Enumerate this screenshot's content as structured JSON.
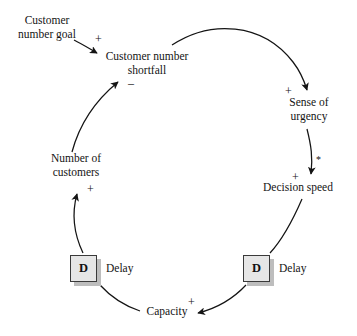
{
  "diagram": {
    "type": "causal-loop-diagram",
    "title": "",
    "ink_color": "#141414",
    "delay_box_fill": "#e6e6e6",
    "delay_box_shadow": "#bdbdbd"
  },
  "nodes": {
    "customer_number_goal": {
      "line1": "Customer",
      "line2": "number goal"
    },
    "customer_number_shortfall": {
      "line1": "Customer number",
      "line2": "shortfall"
    },
    "sense_of_urgency": {
      "line1": "Sense of",
      "line2": "urgency"
    },
    "decision_speed": {
      "line1": "Decision speed",
      "line2": ""
    },
    "capacity": {
      "line1": "Capacity",
      "line2": ""
    },
    "number_of_customers": {
      "line1": "Number of",
      "line2": "customers"
    }
  },
  "delays": {
    "left": {
      "glyph": "D",
      "label": "Delay"
    },
    "right": {
      "glyph": "D",
      "label": "Delay"
    }
  },
  "polarities": {
    "goal_to_shortfall": "+",
    "shortfall_to_urgency": "+",
    "urgency_to_speed_sign": "+",
    "urgency_to_speed_mark": "*",
    "capacity_in": "+",
    "customers_in": "+",
    "customers_to_shortfall": "–"
  },
  "links": [
    {
      "from": "customer_number_goal",
      "to": "customer_number_shortfall",
      "sign": "+"
    },
    {
      "from": "customer_number_shortfall",
      "to": "sense_of_urgency",
      "sign": "+"
    },
    {
      "from": "sense_of_urgency",
      "to": "decision_speed",
      "sign": "+",
      "mark": "*"
    },
    {
      "from": "decision_speed",
      "to": "delay_right",
      "sign": ""
    },
    {
      "from": "delay_right",
      "to": "capacity",
      "sign": "+"
    },
    {
      "from": "capacity",
      "to": "delay_left",
      "sign": ""
    },
    {
      "from": "delay_left",
      "to": "number_of_customers",
      "sign": "+"
    },
    {
      "from": "number_of_customers",
      "to": "customer_number_shortfall",
      "sign": "–"
    }
  ]
}
